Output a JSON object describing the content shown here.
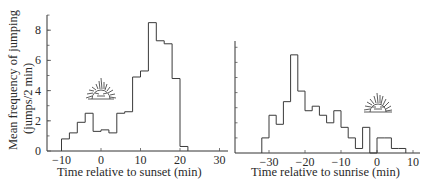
{
  "figure": {
    "ylabel_line1": "Mean frequency of jumping",
    "ylabel_line2": "(jumps/2 min)"
  },
  "chart_data": [
    {
      "type": "bar",
      "subtype": "histogram-step",
      "title": "",
      "xlabel": "Time relative to sunset (min)",
      "ylabel": "Mean frequency of jumping (jumps/2 min)",
      "xlim": [
        -14,
        30
      ],
      "ylim": [
        0,
        9
      ],
      "xticks": [
        -10,
        0,
        10,
        20,
        30
      ],
      "xtick_labels": [
        "−10",
        "0",
        "10",
        "20",
        "30"
      ],
      "yticks": [
        0,
        2,
        4,
        6,
        8
      ],
      "ytick_labels": [
        "0",
        "2",
        "4",
        "6",
        "8"
      ],
      "bin_width_min": 2,
      "bin_edges": [
        -10,
        -8,
        -6,
        -4,
        -2,
        0,
        2,
        4,
        6,
        8,
        10,
        12,
        14,
        16,
        18,
        20,
        22
      ],
      "values": [
        0.8,
        1.2,
        1.9,
        2.5,
        1.3,
        1.4,
        1.2,
        2.5,
        2.6,
        4.9,
        5.3,
        8.5,
        7.3,
        7.1,
        4.8,
        0.3
      ],
      "annotation": "setting-sun-icon",
      "grid": false
    },
    {
      "type": "bar",
      "subtype": "histogram-step",
      "title": "",
      "xlabel": "Time relative to sunrise (min)",
      "ylabel": "",
      "xlim": [
        -40,
        10
      ],
      "ylim": [
        0,
        7.5
      ],
      "xticks": [
        -30,
        -20,
        -10,
        0,
        10
      ],
      "xtick_labels": [
        "−30",
        "−20",
        "−10",
        "0",
        "10"
      ],
      "bin_width_min": 2,
      "bin_edges": [
        -32,
        -30,
        -28,
        -26,
        -24,
        -22,
        -20,
        -18,
        -16,
        -14,
        -12,
        -10,
        -8,
        -6,
        -4,
        -2,
        0,
        2,
        4,
        6,
        8
      ],
      "values": [
        1.0,
        2.5,
        1.9,
        3.4,
        6.5,
        4.1,
        2.8,
        3.1,
        2.5,
        2.0,
        2.8,
        1.7,
        1.0,
        0.3,
        1.7,
        0.0,
        1.0,
        1.0,
        0.3,
        0.3
      ],
      "annotation": "rising-sun-icon",
      "grid": false
    }
  ]
}
